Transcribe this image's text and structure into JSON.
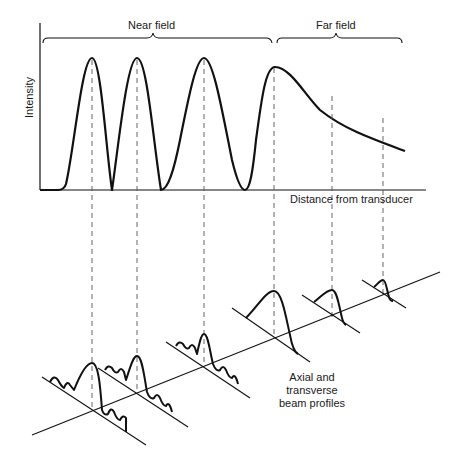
{
  "diagram": {
    "regions": {
      "near_field": "Near field",
      "far_field": "Far field"
    },
    "axes": {
      "y_label": "Intensity",
      "x_label": "Distance from transducer"
    },
    "profiles_caption": {
      "line1": "Axial and",
      "line2": "transverse",
      "line3": "beam profiles"
    },
    "colors": {
      "ink": "#111111",
      "dash": "#555555",
      "background": "#ffffff"
    }
  }
}
